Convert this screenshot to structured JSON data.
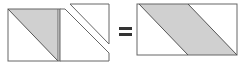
{
  "diagram": {
    "operator_equals": "=",
    "colors": {
      "stroke": "#555555",
      "fill_shaded": "#d0d0d0",
      "background": "#ffffff"
    }
  }
}
